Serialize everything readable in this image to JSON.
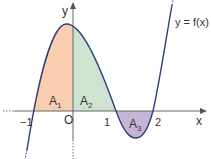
{
  "figure": {
    "function_label": "y = f(x)",
    "axis_labels": {
      "x": "x",
      "y": "y"
    },
    "origin_label": "O",
    "ticks": [
      {
        "label": "−1",
        "value": -1
      },
      {
        "label": "1",
        "value": 1
      },
      {
        "label": "2",
        "value": 2
      }
    ],
    "regions": [
      {
        "name": "A",
        "sub": "1",
        "interval": [
          -1,
          0
        ],
        "color": "#f8cdb0"
      },
      {
        "name": "A",
        "sub": "2",
        "interval": [
          0,
          1
        ],
        "color": "#cfe4d0"
      },
      {
        "name": "A",
        "sub": "3",
        "interval": [
          1,
          2
        ],
        "color": "#c6b4d6"
      }
    ],
    "colors": {
      "curve": "#2e3f7c",
      "axis": "#555555"
    }
  }
}
